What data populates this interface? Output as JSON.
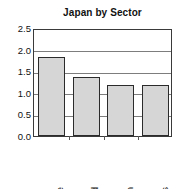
{
  "chart_data": {
    "type": "bar",
    "title": "Japan by Sector",
    "xlabel": "",
    "ylabel": "",
    "categories": [
      "Textile",
      "Food",
      "Engin",
      "Stores"
    ],
    "values": [
      1.83,
      1.37,
      1.18,
      1.18
    ],
    "ylim": [
      0.0,
      2.5
    ],
    "yticks": [
      "0.0",
      "0.5",
      "1.0",
      "1.5",
      "2.0",
      "2.5"
    ],
    "ytick_values": [
      0.0,
      0.5,
      1.0,
      1.5,
      2.0,
      2.5
    ],
    "grid": true,
    "legend": false,
    "legend_position": "none",
    "bar_fill_color": "#d6d6d6",
    "bar_border_color": "#2b2b2b",
    "gridline_color": "#7d7d7d",
    "frame_color": "#3a3a3a",
    "label_rotation": 90
  }
}
